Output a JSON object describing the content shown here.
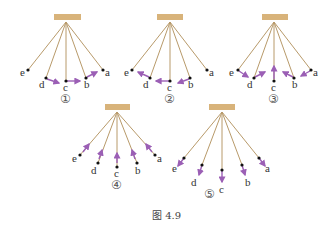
{
  "figure": {
    "caption": "图 4.9",
    "colors": {
      "support": "#d8b37a",
      "string": "#b89a6a",
      "arrow": "#9b5fb5",
      "point": "#111111"
    },
    "panels": [
      {
        "number": "①",
        "description": "arrows d→c, c→b, b→a (wave travelling rightward along points)",
        "points": [
          "e",
          "d",
          "c",
          "b",
          "a"
        ]
      },
      {
        "number": "②",
        "description": "arrows b→c, c→d, d→e (wave travelling leftward along points)",
        "points": [
          "e",
          "d",
          "c",
          "b",
          "a"
        ]
      },
      {
        "number": "③",
        "description": "arrows at each point perpendicular to strings, pointing toward the centre",
        "points": [
          "e",
          "d",
          "c",
          "b",
          "a"
        ]
      },
      {
        "number": "④",
        "description": "arrows along strings pointing toward the pivot",
        "points": [
          "e",
          "d",
          "c",
          "b",
          "a"
        ]
      },
      {
        "number": "⑤",
        "description": "arrows along strings pointing away from the pivot",
        "points": [
          "e",
          "d",
          "c",
          "b",
          "a"
        ]
      }
    ]
  }
}
